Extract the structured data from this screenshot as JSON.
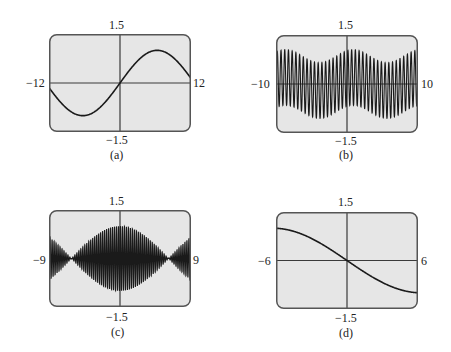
{
  "chart_data": [
    {
      "id": "a",
      "type": "line",
      "caption": "(a)",
      "xlim": [
        -12,
        12
      ],
      "ylim": [
        -1.5,
        1.5
      ],
      "tick_labels": {
        "xmin": "−12",
        "xmax": "12",
        "ymax": "1.5",
        "ymin": "−1.5"
      },
      "grid": false,
      "description": "smooth sine wave, one full period; min near x=-6.3 (y≈-1), max near x=6.3 (y≈1)",
      "function": "sin(x/4)",
      "x": [
        -12,
        -9,
        -6,
        -3,
        0,
        3,
        6,
        9,
        12
      ],
      "y": [
        -0.14,
        -0.78,
        -1.0,
        -0.68,
        0,
        0.68,
        1.0,
        0.78,
        0.14
      ]
    },
    {
      "id": "b",
      "type": "line",
      "caption": "(b)",
      "xlim": [
        -10,
        10
      ],
      "ylim": [
        -1.5,
        1.5
      ],
      "tick_labels": {
        "xmin": "−10",
        "xmax": "10",
        "ymax": "1.5",
        "ymin": "−1.5"
      },
      "grid": false,
      "description": "rapid oscillation (~38 cycles) with slowly varying offset envelope between about ±0.6 and ±1.05",
      "function": "0.85*sin(12x) + 0.2*sin(0.66x + 1)",
      "envelope_upper": {
        "x": [
          -10,
          -7.5,
          -2.5,
          1.5,
          7,
          10
        ],
        "y": [
          0.75,
          1.05,
          0.65,
          1.05,
          0.65,
          1.0
        ]
      },
      "envelope_lower": {
        "x": [
          -10,
          -7.5,
          -2.5,
          1.5,
          7,
          10
        ],
        "y": [
          -0.95,
          -0.65,
          -1.05,
          -0.65,
          -1.05,
          -0.7
        ]
      }
    },
    {
      "id": "c",
      "type": "line",
      "caption": "(c)",
      "xlim": [
        -9,
        9
      ],
      "ylim": [
        -1.5,
        1.5
      ],
      "tick_labels": {
        "xmin": "−9",
        "xmax": "9",
        "ymax": "1.5",
        "ymin": "−1.5"
      },
      "grid": false,
      "description": "rapid oscillation with amplitude-modulated (beat) envelope; maximum amplitude ≈1 at x=0, nodes near x≈±6.2, amplitude ≈0.55 at edges",
      "function": "cos(x/4)*sin(25x)",
      "envelope_upper": {
        "x": [
          -9,
          -6.2,
          -3,
          0,
          3,
          6.2,
          9
        ],
        "y": [
          0.55,
          0,
          0.7,
          1.0,
          0.7,
          0,
          0.55
        ]
      }
    },
    {
      "id": "d",
      "type": "line",
      "caption": "(d)",
      "xlim": [
        -6,
        6
      ],
      "ylim": [
        -1.5,
        1.5
      ],
      "tick_labels": {
        "xmin": "−6",
        "xmax": "6",
        "ymax": "1.5",
        "ymin": "−1.5"
      },
      "grid": false,
      "description": "smooth decreasing curve through origin, from ≈1 at x=-6 to ≈-1 at x=6",
      "function": "-sin(x/4)",
      "x": [
        -6,
        -4.5,
        -3,
        -1.5,
        0,
        1.5,
        3,
        4.5,
        6
      ],
      "y": [
        1.0,
        0.9,
        0.68,
        0.37,
        0,
        -0.37,
        -0.68,
        -0.9,
        -1.0
      ]
    }
  ],
  "panels": [
    {
      "caption": "(a)",
      "ymax": "1.5",
      "ymin": "−1.5",
      "xmin": "−12",
      "xmax": "12"
    },
    {
      "caption": "(b)",
      "ymax": "1.5",
      "ymin": "−1.5",
      "xmin": "−10",
      "xmax": "10"
    },
    {
      "caption": "(c)",
      "ymax": "1.5",
      "ymin": "−1.5",
      "xmin": "−9",
      "xmax": "9"
    },
    {
      "caption": "(d)",
      "ymax": "1.5",
      "ymin": "−1.5",
      "xmin": "−6",
      "xmax": "6"
    }
  ],
  "colors": {
    "plot_bg": "#e6e6e6",
    "frame": "#555555",
    "curve": "#1a1a1a",
    "axis": "#3a3a3a"
  }
}
